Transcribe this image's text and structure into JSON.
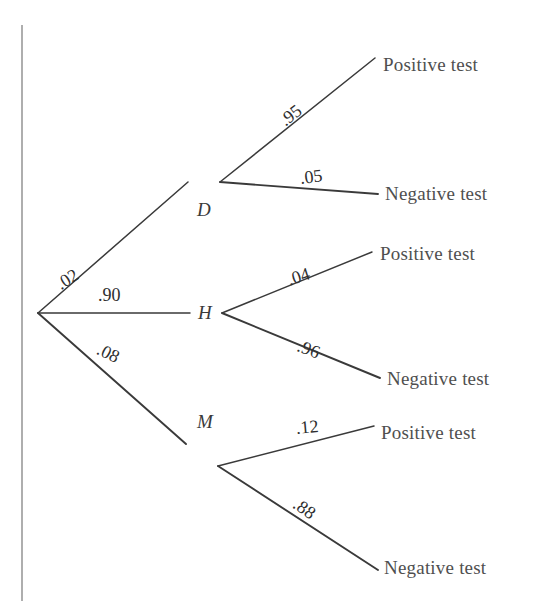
{
  "figure": {
    "type": "probability-tree-diagram",
    "title": "",
    "background_color": "#ffffff",
    "line_color": "#3a3a3a",
    "text_color": "#4f4f4f",
    "rule_color": "#9a9a9a"
  },
  "root": {
    "name": "root-node",
    "x": 38,
    "y": 313
  },
  "left_rule": {
    "name": "vertical-rule",
    "x": 22,
    "y_top": 25,
    "y_bottom": 601
  },
  "branches": {
    "level1": [
      {
        "id": "D",
        "node_label": "D",
        "probability": ".02",
        "node_x": 220,
        "node_y": 182,
        "label_x": 197,
        "label_y": 199,
        "prob_x": 58,
        "prob_y": 275,
        "prob_rotate": -32
      },
      {
        "id": "H",
        "node_label": "H",
        "probability": ".90",
        "node_x": 222,
        "node_y": 313,
        "label_x": 198,
        "label_y": 302,
        "prob_x": 98,
        "prob_y": 285,
        "prob_rotate": 0
      },
      {
        "id": "M",
        "node_label": "M",
        "probability": ".08",
        "node_x": 218,
        "node_y": 444,
        "label_x": 197,
        "label_y": 411,
        "prob_x": 98,
        "prob_y": 338,
        "prob_rotate": 26
      }
    ],
    "level2": [
      {
        "parent": "D",
        "probability": ".95",
        "outcome": "Positive test",
        "end_x": 375,
        "end_y": 58,
        "out_x": 383,
        "out_y": 54,
        "prob_x": 282,
        "prob_y": 112,
        "prob_rotate": -38
      },
      {
        "parent": "D",
        "probability": ".05",
        "outcome": "Negative test",
        "end_x": 378,
        "end_y": 194,
        "out_x": 385,
        "out_y": 183,
        "prob_x": 300,
        "prob_y": 168,
        "prob_rotate": -7
      },
      {
        "parent": "H",
        "probability": ".04",
        "outcome": "Positive test",
        "end_x": 372,
        "end_y": 252,
        "out_x": 380,
        "out_y": 243,
        "prob_x": 288,
        "prob_y": 270,
        "prob_rotate": -18
      },
      {
        "parent": "H",
        "probability": ".96",
        "outcome": "Negative test",
        "end_x": 380,
        "end_y": 378,
        "out_x": 387,
        "out_y": 368,
        "prob_x": 298,
        "prob_y": 335,
        "prob_rotate": 21
      },
      {
        "parent": "M",
        "probability": ".12",
        "outcome": "Positive test",
        "end_x": 374,
        "end_y": 426,
        "out_x": 381,
        "out_y": 422,
        "prob_x": 296,
        "prob_y": 418,
        "prob_rotate": -5
      },
      {
        "parent": "M",
        "probability": ".88",
        "outcome": "Negative test",
        "end_x": 378,
        "end_y": 570,
        "out_x": 384,
        "out_y": 557,
        "prob_x": 295,
        "prob_y": 492,
        "prob_rotate": 35
      }
    ]
  },
  "chart_data": {
    "type": "diagram",
    "root_label": "",
    "stage1": {
      "label": "Condition",
      "categories": [
        "D",
        "H",
        "M"
      ],
      "values": [
        0.02,
        0.9,
        0.08
      ],
      "value_labels": [
        ".02",
        ".90",
        ".08"
      ]
    },
    "stage2": {
      "label": "Test result",
      "categories": [
        "Positive test",
        "Negative test"
      ],
      "conditional": [
        {
          "given": "D",
          "outcomes": [
            "Positive test",
            "Negative test"
          ],
          "values": [
            0.95,
            0.05
          ],
          "value_labels": [
            ".95",
            ".05"
          ]
        },
        {
          "given": "H",
          "outcomes": [
            "Positive test",
            "Negative test"
          ],
          "values": [
            0.04,
            0.96
          ],
          "value_labels": [
            ".04",
            ".96"
          ]
        },
        {
          "given": "M",
          "outcomes": [
            "Positive test",
            "Negative test"
          ],
          "values": [
            0.12,
            0.88
          ],
          "value_labels": [
            ".12",
            ".88"
          ]
        }
      ]
    }
  }
}
